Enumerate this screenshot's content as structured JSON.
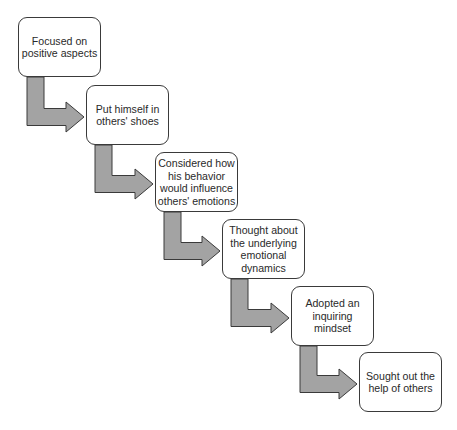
{
  "diagram": {
    "type": "staircase-flow",
    "colors": {
      "box_border": "#3a3a3a",
      "box_fill": "#ffffff",
      "text": "#2a2a2a",
      "arrow_fill": "#a3a3a3",
      "arrow_stroke": "#3a3a3a"
    },
    "steps": [
      {
        "label": "Focused on positive aspects"
      },
      {
        "label": "Put himself in others' shoes"
      },
      {
        "label": "Considered how his behavior would influence others' emotions"
      },
      {
        "label": "Thought about the underlying emotional dynamics"
      },
      {
        "label": "Adopted an inquiring mindset"
      },
      {
        "label": "Sought out the help of others"
      }
    ]
  }
}
